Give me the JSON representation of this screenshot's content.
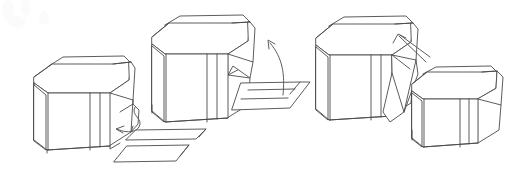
{
  "figure": {
    "background_color": "#ffffff",
    "line_color": "#4a4a4a",
    "arrow_color": "#5d5d5d",
    "width": 527,
    "height": 177,
    "style": "technical line drawing"
  },
  "stages": [
    {
      "id": "stage-1",
      "label": "Closed carton with base inserts",
      "caption": ""
    },
    {
      "id": "stage-2",
      "label": "Carton above flat tray insert",
      "caption": ""
    },
    {
      "id": "stage-3",
      "label": "Carton with side flap opened",
      "caption": ""
    },
    {
      "id": "stage-4",
      "label": "Finished sealed carton",
      "caption": ""
    }
  ],
  "parts": [
    {
      "id": "tray-lower-left-a",
      "label": "flat sheet insert upper"
    },
    {
      "id": "tray-lower-left-b",
      "label": "flat sheet insert lower"
    },
    {
      "id": "tray-center",
      "label": "flat tray base"
    }
  ],
  "arrows": [
    {
      "id": "arrow-stage1",
      "label": "insert sheets into carton",
      "direction": "left"
    },
    {
      "id": "arrow-stage2",
      "label": "lift carton onto tray",
      "direction": "up-left"
    },
    {
      "id": "arrow-stage3",
      "label": "fold flap closed",
      "direction": "up-left"
    }
  ]
}
